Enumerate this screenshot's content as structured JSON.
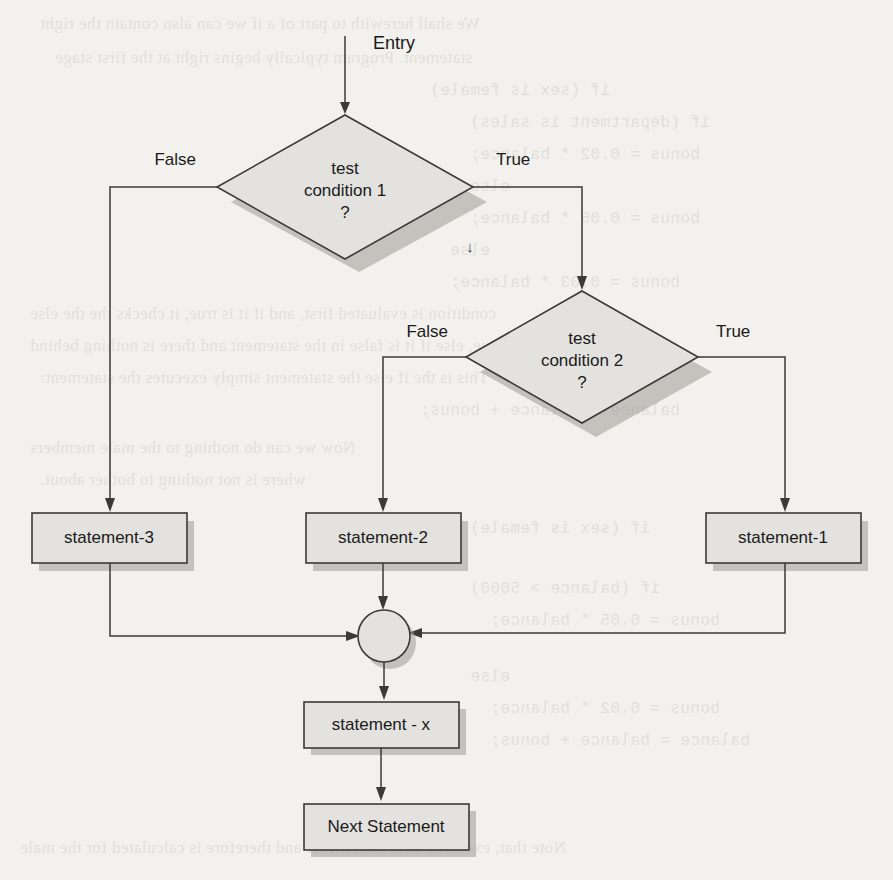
{
  "diagram": {
    "entry_label": "Entry",
    "stray_mark": "↓",
    "colors": {
      "shape_fill": "#e3e2df",
      "shape_stroke": "#3a3a38",
      "shadow": "#9c9a95",
      "text": "#1a1a1a",
      "page_background": "#f3f1ed"
    },
    "decisions": [
      {
        "id": "test-condition-1",
        "line1": "test",
        "line2": "condition 1",
        "line3": "?",
        "false_label": "False",
        "true_label": "True"
      },
      {
        "id": "test-condition-2",
        "line1": "test",
        "line2": "condition 2",
        "line3": "?",
        "false_label": "False",
        "true_label": "True"
      }
    ],
    "process_boxes": [
      {
        "id": "statement-3",
        "label": "statement-3"
      },
      {
        "id": "statement-2",
        "label": "statement-2"
      },
      {
        "id": "statement-1",
        "label": "statement-1"
      },
      {
        "id": "statement-x",
        "label": "statement - x"
      },
      {
        "id": "next-statement",
        "label": "Next Statement"
      }
    ],
    "merge_node": {
      "id": "merge-junction",
      "shape": "circle"
    }
  },
  "background_text": {
    "lines": [
      "We shall herewith to part of a if we can also contain the right",
      "statement. Program typically begins right at the first stage",
      "if (sex is female)",
      "if (department is sales)",
      "bonus = 0.02 * balance;",
      "else",
      "bonus = 0.05 * balance;",
      "else",
      "bonus = 0.03 * balance;",
      "condition is evaluated first, and if it is true, it checks the the else",
      "if it is true, else if it is false in the statement and there is nothing behind",
      "This is the if else the statement simply executes the statement:",
      "balance = balance + bonus;",
      "Now we can do nothing to the male members",
      "where is not nothing to bother about.",
      "if (sex is female)",
      "if (balance > 5000)",
      "bonus = 0.05 * balance;",
      "else",
      "bonus = 0.02 * balance;",
      "balance = balance + bonus;",
      "Note that, executed with the outer if and therefore is calculated for the male"
    ]
  }
}
